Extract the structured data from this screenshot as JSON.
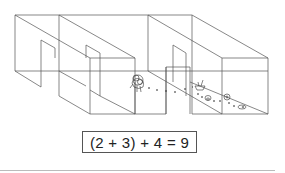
{
  "diagram": {
    "line_color": "#555555",
    "equation": "(2 + 3) + 4 = 9",
    "elements": [
      {
        "name": "creature",
        "position": [
          137,
          82
        ]
      },
      {
        "name": "boat-object",
        "position": [
          200,
          85
        ]
      },
      {
        "name": "basket-object",
        "position": [
          207,
          98
        ]
      },
      {
        "name": "small-circle-object",
        "position": [
          227,
          97
        ]
      },
      {
        "name": "bowl-object",
        "position": [
          241,
          107
        ]
      }
    ]
  }
}
